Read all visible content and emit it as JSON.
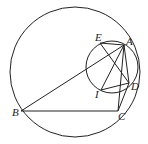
{
  "diagram": {
    "type": "geometry",
    "points": {
      "A": {
        "label": "A",
        "x": 124,
        "y": 45
      },
      "B": {
        "label": "B",
        "x": 21,
        "y": 111
      },
      "C": {
        "label": "C",
        "x": 118,
        "y": 111
      },
      "D": {
        "label": "D",
        "x": 129,
        "y": 83
      },
      "E": {
        "label": "E",
        "x": 100,
        "y": 43
      },
      "I": {
        "label": "I",
        "x": 101,
        "y": 90
      }
    },
    "circles": [
      {
        "name": "circumcircle",
        "cx": 75,
        "cy": 72,
        "r": 65
      },
      {
        "name": "small-circle",
        "cx": 112,
        "cy": 67,
        "r": 26
      }
    ],
    "segments": [
      [
        "A",
        "B"
      ],
      [
        "B",
        "C"
      ],
      [
        "A",
        "C"
      ],
      [
        "A",
        "E"
      ],
      [
        "A",
        "I"
      ],
      [
        "A",
        "D"
      ],
      [
        "E",
        "D"
      ],
      [
        "I",
        "D"
      ],
      [
        "D",
        "C"
      ]
    ],
    "colors": {
      "stroke": "#222222",
      "background": "#ffffff"
    }
  }
}
